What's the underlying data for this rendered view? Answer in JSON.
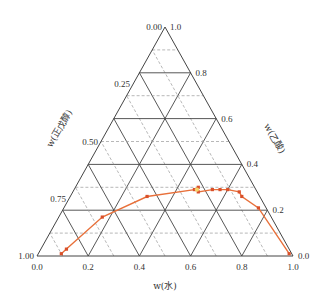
{
  "chart_data": {
    "type": "scatter",
    "subtype": "ternary",
    "title": "",
    "axes": {
      "bottom": {
        "label": "w(水)",
        "ticks": [
          "0.0",
          "0.2",
          "0.4",
          "0.6",
          "0.8",
          "1.0"
        ],
        "range": [
          0,
          1
        ]
      },
      "right": {
        "label": "w(乙酸)",
        "ticks": [
          "0.0",
          "0.2",
          "0.4",
          "0.6",
          "0.8",
          "1.0"
        ],
        "range": [
          0,
          1
        ]
      },
      "left": {
        "label": "w(正戊醇)",
        "ticks": [
          "1.00",
          "0.75",
          "0.50",
          "0.25",
          "0.00"
        ],
        "range": [
          1,
          0
        ]
      }
    },
    "grid": {
      "solid_step": 0.2,
      "dashed_step": 0.1,
      "dashed_color": "#9a9a9a",
      "solid_color": "#444444"
    },
    "series": [
      {
        "name": "binodal curve",
        "color": "#E8703A",
        "marker_color": "#D9502A",
        "points": [
          {
            "water": 0.09,
            "acetic_acid": 0.01
          },
          {
            "water": 0.1,
            "acetic_acid": 0.03
          },
          {
            "water": 0.17,
            "acetic_acid": 0.17
          },
          {
            "water": 0.3,
            "acetic_acid": 0.26
          },
          {
            "water": 0.47,
            "acetic_acid": 0.29
          },
          {
            "water": 0.48,
            "acetic_acid": 0.3
          },
          {
            "water": 0.49,
            "acetic_acid": 0.28
          },
          {
            "water": 0.54,
            "acetic_acid": 0.29
          },
          {
            "water": 0.57,
            "acetic_acid": 0.29
          },
          {
            "water": 0.6,
            "acetic_acid": 0.29
          },
          {
            "water": 0.65,
            "acetic_acid": 0.28
          },
          {
            "water": 0.67,
            "acetic_acid": 0.26
          },
          {
            "water": 0.76,
            "acetic_acid": 0.21
          },
          {
            "water": 0.98,
            "acetic_acid": 0.01
          }
        ],
        "plait_point": {
          "water": 0.48,
          "acetic_acid": 0.29,
          "color": "#F6D56A"
        }
      }
    ]
  },
  "labels": {
    "bottom_axis": "w(水)",
    "right_axis": "w(乙酸)",
    "left_axis": "w(正戊醇)"
  }
}
